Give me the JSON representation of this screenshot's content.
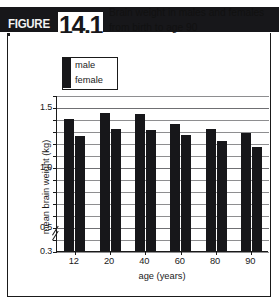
{
  "header": {
    "figure_word": "FIGURE",
    "figure_number": "14.1",
    "title_line1": "Brain weight in males and females",
    "title_line2": "from birth to age 90",
    "bar_color": "#17171a",
    "number_box_color": "#ffffff"
  },
  "legend": {
    "items": [
      {
        "label": "male",
        "color": "#17171a"
      },
      {
        "label": "female",
        "color": "#17171a"
      }
    ]
  },
  "chart_data": {
    "type": "bar",
    "title": "Brain weight in males and females from birth to age 90",
    "xlabel": "age (years)",
    "ylabel": "mean brain weight (kg)",
    "categories": [
      "12",
      "20",
      "40",
      "60",
      "80",
      "90"
    ],
    "series": [
      {
        "name": "male",
        "color": "#17171a",
        "values": [
          1.4,
          1.45,
          1.44,
          1.36,
          1.32,
          1.28
        ]
      },
      {
        "name": "female",
        "color": "#17171a",
        "values": [
          1.26,
          1.32,
          1.31,
          1.27,
          1.22,
          1.17
        ]
      }
    ],
    "ylim": [
      0.3,
      1.6
    ],
    "yticks": [
      0.3,
      0.4,
      0.5,
      0.6,
      0.7,
      0.8,
      0.9,
      1.0,
      1.1,
      1.2,
      1.3,
      1.4,
      1.5,
      1.6
    ],
    "ytick_labels": [
      {
        "value": 1.5,
        "label": "1.5"
      },
      {
        "value": 1.0,
        "label": "1.0"
      },
      {
        "value": 0.5,
        "label": "0.5"
      },
      {
        "value": 0.3,
        "label": "0.3"
      }
    ],
    "grid": true,
    "axis_break": true,
    "axis_break_note": "y-axis broken below 0.3",
    "legend_position": "top-left-inside"
  }
}
